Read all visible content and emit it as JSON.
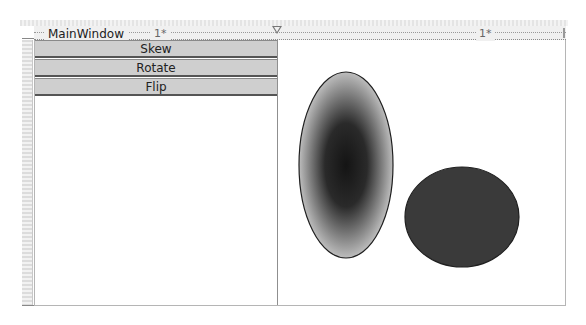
{
  "designer": {
    "window_title": "MainWindow",
    "column_definitions": [
      {
        "label": "1*"
      },
      {
        "label": "1*"
      }
    ]
  },
  "left_panel": {
    "buttons": [
      {
        "label": "Skew"
      },
      {
        "label": "Rotate"
      },
      {
        "label": "Flip"
      }
    ]
  },
  "right_panel": {
    "shapes": [
      {
        "type": "ellipse",
        "name": "gradient-ellipse",
        "fill": "radial-gradient",
        "center_color": "#1a1a1a",
        "edge_color": "#bdbdbd",
        "stroke": "#1f1f1f"
      },
      {
        "type": "ellipse",
        "name": "solid-ellipse",
        "fill": "#3a3a3a",
        "stroke": "#1f1f1f"
      }
    ]
  },
  "colors": {
    "button_bg": "#cfcfcf",
    "button_border": "#555555",
    "splitter": "#8f8f8f"
  }
}
